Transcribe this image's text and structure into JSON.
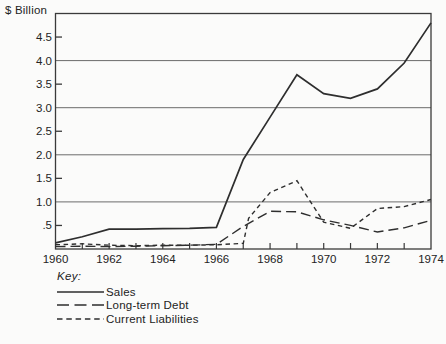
{
  "title": "$ Billion",
  "key": {
    "heading": "Key:",
    "entries": [
      {
        "label": "Sales",
        "style": "solid"
      },
      {
        "label": "Long-term Debt",
        "style": "long-dash"
      },
      {
        "label": "Current Liabilities",
        "style": "short-dash"
      }
    ]
  },
  "colors": {
    "background": "#fbfbfa",
    "frame": "#3a3a3a",
    "grid": "#6b6b6b",
    "line": "#2e2e2e",
    "text": "#232323"
  },
  "chart_data": {
    "type": "line",
    "title": "",
    "ylabel": "$ Billion",
    "xlabel": "",
    "xlim": [
      1960,
      1974
    ],
    "ylim": [
      0,
      5
    ],
    "grid": "horizontal-major-only",
    "gridlines_at": [
      1,
      2,
      3,
      4
    ],
    "y_ticks": [
      {
        "v": 4.5,
        "label": "4.5"
      },
      {
        "v": 4.0,
        "label": "4.0"
      },
      {
        "v": 3.5,
        "label": "3.5"
      },
      {
        "v": 3.0,
        "label": "3.0"
      },
      {
        "v": 2.5,
        "label": "2.5"
      },
      {
        "v": 2.0,
        "label": "2.0"
      },
      {
        "v": 1.5,
        "label": "1.5"
      },
      {
        "v": 1.0,
        "label": "1.0"
      },
      {
        "v": 0.5,
        "label": ".5"
      }
    ],
    "y_half_ticks_at": [
      0.5,
      1.5,
      2.5,
      3.5,
      4.5
    ],
    "x_minor_ticks_every": 1,
    "x_tick_labels": [
      "1960",
      "1962",
      "1964",
      "1966",
      "1968",
      "1970",
      "1972",
      "1974"
    ],
    "x_tick_label_years": [
      1960,
      1962,
      1964,
      1966,
      1968,
      1970,
      1972,
      1974
    ],
    "legend_position": "bottom-left",
    "series": [
      {
        "name": "Sales",
        "dash": "solid",
        "points": [
          [
            1960,
            0.13
          ],
          [
            1961,
            0.26
          ],
          [
            1962,
            0.42
          ],
          [
            1963,
            0.42
          ],
          [
            1964,
            0.43
          ],
          [
            1965,
            0.44
          ],
          [
            1966,
            0.46
          ],
          [
            1967,
            1.9
          ],
          [
            1968,
            2.8
          ],
          [
            1969,
            3.7
          ],
          [
            1970,
            3.3
          ],
          [
            1971,
            3.2
          ],
          [
            1972,
            3.4
          ],
          [
            1973,
            3.95
          ],
          [
            1974,
            4.8
          ]
        ]
      },
      {
        "name": "Long-term Debt",
        "dash": "long",
        "points": [
          [
            1960,
            0.05
          ],
          [
            1961,
            0.06
          ],
          [
            1962,
            0.05
          ],
          [
            1963,
            0.06
          ],
          [
            1964,
            0.07
          ],
          [
            1965,
            0.08
          ],
          [
            1966,
            0.1
          ],
          [
            1967,
            0.48
          ],
          [
            1968,
            0.8
          ],
          [
            1969,
            0.79
          ],
          [
            1970,
            0.62
          ],
          [
            1971,
            0.5
          ],
          [
            1972,
            0.36
          ],
          [
            1973,
            0.45
          ],
          [
            1974,
            0.61
          ]
        ]
      },
      {
        "name": "Current Liabilities",
        "dash": "short",
        "points": [
          [
            1960,
            0.09
          ],
          [
            1961,
            0.11
          ],
          [
            1962,
            0.08
          ],
          [
            1963,
            0.07
          ],
          [
            1964,
            0.08
          ],
          [
            1965,
            0.08
          ],
          [
            1966,
            0.09
          ],
          [
            1967,
            0.12
          ],
          [
            1967.2,
            0.65
          ],
          [
            1968,
            1.2
          ],
          [
            1969,
            1.45
          ],
          [
            1970,
            0.57
          ],
          [
            1971,
            0.44
          ],
          [
            1972,
            0.86
          ],
          [
            1973,
            0.9
          ],
          [
            1974,
            1.05
          ]
        ]
      }
    ]
  }
}
